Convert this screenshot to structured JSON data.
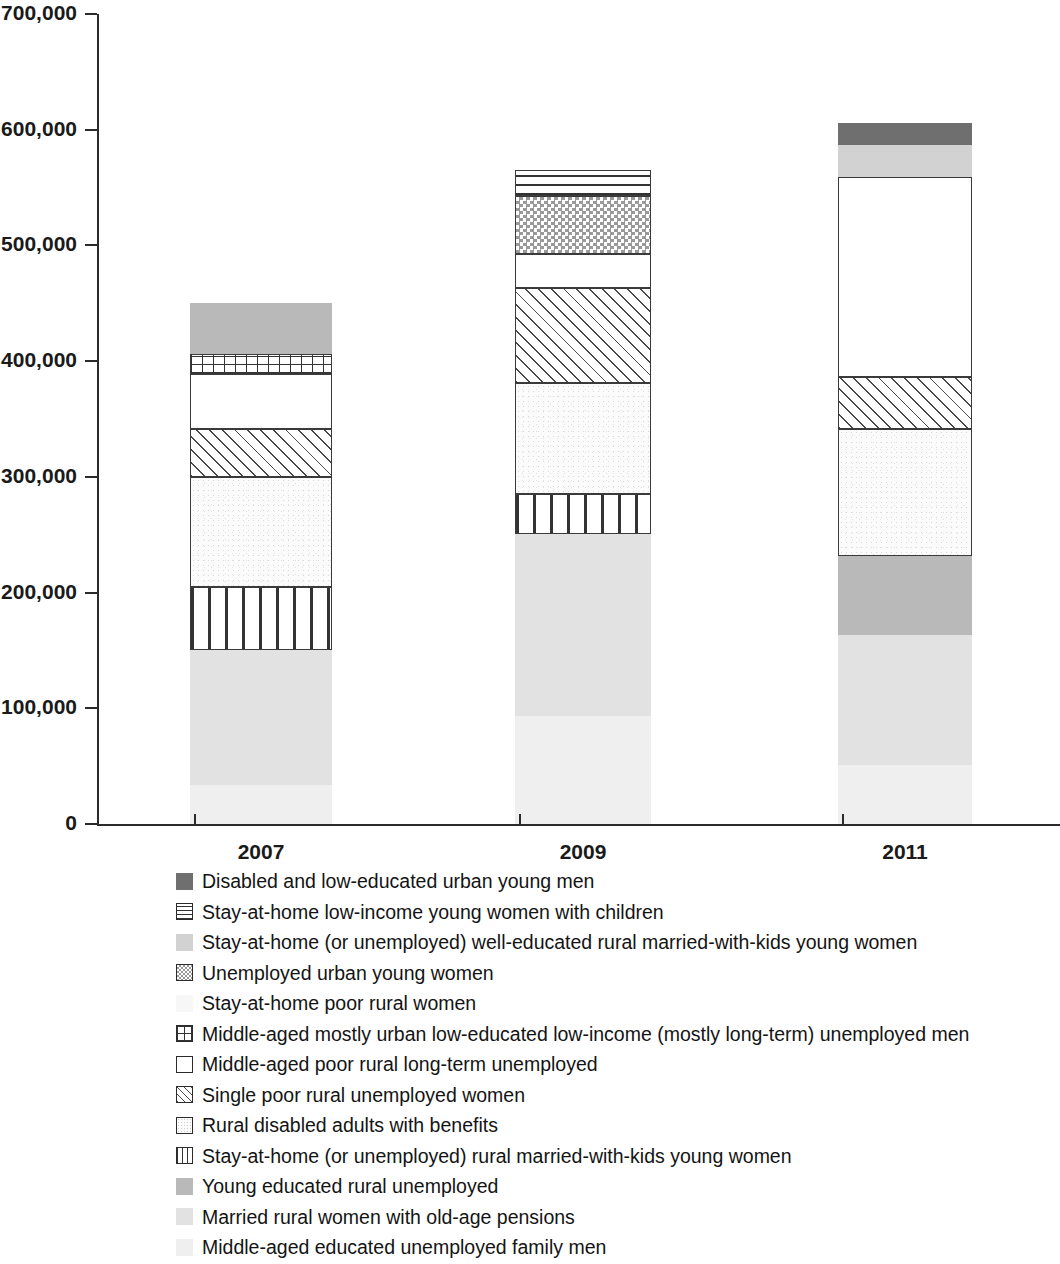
{
  "chart_data": {
    "type": "bar",
    "subtype": "stacked-bar",
    "title": "",
    "xlabel": "",
    "ylabel": "",
    "categories": [
      "2007",
      "2009",
      "2011"
    ],
    "ylim": [
      0,
      700000
    ],
    "ytick_labels": [
      "0",
      "100,000",
      "200,000",
      "300,000",
      "400,000",
      "500,000",
      "600,000",
      "700,000"
    ],
    "ytick_values": [
      0,
      100000,
      200000,
      300000,
      400000,
      500000,
      600000,
      700000
    ],
    "grid": false,
    "legend_position": "below",
    "totals": [
      456000,
      565000,
      604000
    ],
    "series": [
      {
        "name": "Disabled and low-educated urban young men",
        "pattern": "solid-dark-gray",
        "color": "#6f6f6f",
        "values": [
          0,
          0,
          19000
        ]
      },
      {
        "name": "Stay-at-home low-income young women with children",
        "pattern": "horizontal-lines",
        "color": "#ffffff",
        "values": [
          0,
          22000,
          0
        ]
      },
      {
        "name": "Stay-at-home (or unemployed) well-educated rural married-with-kids young women",
        "pattern": "solid-light-gray",
        "color": "#d2d2d2",
        "values": [
          0,
          0,
          28000
        ]
      },
      {
        "name": "Unemployed urban young women",
        "pattern": "checkerboard",
        "color": "#9a9a9a",
        "values": [
          0,
          50000,
          0
        ]
      },
      {
        "name": "Stay-at-home poor rural women",
        "pattern": "very-faint-speckle",
        "color": "#f7f7f7",
        "values": [
          44000,
          0,
          0
        ]
      },
      {
        "name": "Middle-aged mostly urban low-educated low-income (mostly long-term) unemployed men",
        "pattern": "grid",
        "color": "#ffffff",
        "values": [
          17000,
          0,
          0
        ]
      },
      {
        "name": "Middle-aged poor rural long-term unemployed",
        "pattern": "white-outline",
        "color": "#ffffff",
        "values": [
          48000,
          30000,
          173000
        ]
      },
      {
        "name": "Single poor rural unemployed women",
        "pattern": "diagonal-hatch",
        "color": "#ffffff",
        "values": [
          41000,
          82000,
          45000
        ]
      },
      {
        "name": "Rural disabled adults with benefits",
        "pattern": "fine-speckle-outline",
        "color": "#fbfbfb",
        "values": [
          95000,
          96000,
          109000
        ]
      },
      {
        "name": "Stay-at-home (or unemployed) rural married-with-kids young women",
        "pattern": "vertical-bars",
        "color": "#ffffff",
        "values": [
          55000,
          34000,
          0
        ]
      },
      {
        "name": "Young educated rural unemployed",
        "pattern": "solid-gray",
        "color": "#b9b9b9",
        "values": [
          0,
          0,
          69000
        ]
      },
      {
        "name": "Married rural women with old-age pensions",
        "pattern": "solid-pale-gray",
        "color": "#dcdcdc",
        "values": [
          116000,
          158000,
          112000
        ]
      },
      {
        "name": "Middle-aged educated unemployed family men",
        "pattern": "solid-palest",
        "color": "#f0f0f0",
        "values": [
          34000,
          93000,
          51000
        ]
      }
    ],
    "bars": [
      {
        "category": "2007",
        "total": 456000,
        "segments_bottom_to_top": [
          {
            "label": "Middle-aged educated unemployed family men",
            "value": 34000,
            "pattern": "solid-palest"
          },
          {
            "label": "Married rural women with old-age pensions",
            "value": 116000,
            "pattern": "solid-pale-gray"
          },
          {
            "label": "Stay-at-home (or unemployed) rural married-with-kids young women",
            "value": 55000,
            "pattern": "vertical-bars"
          },
          {
            "label": "Rural disabled adults with benefits",
            "value": 95000,
            "pattern": "fine-speckle-outline"
          },
          {
            "label": "Single poor rural unemployed women",
            "value": 41000,
            "pattern": "diagonal-hatch"
          },
          {
            "label": "Middle-aged poor rural long-term unemployed",
            "value": 48000,
            "pattern": "white-outline"
          },
          {
            "label": "Middle-aged mostly urban low-educated low-income (mostly long-term) unemployed men",
            "value": 17000,
            "pattern": "grid"
          },
          {
            "label": "Stay-at-home poor rural women",
            "value": 44000,
            "pattern": "solid-gray"
          }
        ]
      },
      {
        "category": "2009",
        "total": 565000,
        "segments_bottom_to_top": [
          {
            "label": "Middle-aged educated unemployed family men",
            "value": 93000,
            "pattern": "solid-palest"
          },
          {
            "label": "Married rural women with old-age pensions",
            "value": 158000,
            "pattern": "solid-pale-gray"
          },
          {
            "label": "Stay-at-home (or unemployed) rural married-with-kids young women",
            "value": 34000,
            "pattern": "vertical-bars"
          },
          {
            "label": "Rural disabled adults with benefits",
            "value": 96000,
            "pattern": "fine-speckle-outline"
          },
          {
            "label": "Single poor rural unemployed women",
            "value": 82000,
            "pattern": "diagonal-hatch"
          },
          {
            "label": "Middle-aged poor rural long-term unemployed",
            "value": 30000,
            "pattern": "white-outline"
          },
          {
            "label": "Unemployed urban young women",
            "value": 50000,
            "pattern": "checkerboard"
          },
          {
            "label": "Stay-at-home low-income young women with children",
            "value": 22000,
            "pattern": "horizontal-lines"
          }
        ]
      },
      {
        "category": "2011",
        "total": 604000,
        "segments_bottom_to_top": [
          {
            "label": "Middle-aged educated unemployed family men",
            "value": 51000,
            "pattern": "solid-palest"
          },
          {
            "label": "Married rural women with old-age pensions",
            "value": 112000,
            "pattern": "solid-pale-gray"
          },
          {
            "label": "Young educated rural unemployed",
            "value": 69000,
            "pattern": "solid-gray"
          },
          {
            "label": "Rural disabled adults with benefits",
            "value": 109000,
            "pattern": "fine-speckle-outline"
          },
          {
            "label": "Single poor rural unemployed women",
            "value": 45000,
            "pattern": "diagonal-hatch"
          },
          {
            "label": "Middle-aged poor rural long-term unemployed",
            "value": 173000,
            "pattern": "white-outline"
          },
          {
            "label": "Stay-at-home (or unemployed) well-educated rural married-with-kids young women",
            "value": 28000,
            "pattern": "solid-light-gray"
          },
          {
            "label": "Disabled and low-educated urban young men",
            "value": 19000,
            "pattern": "solid-dark-gray"
          }
        ]
      }
    ]
  },
  "legend": {
    "items": [
      {
        "pattern": "p-darkgray",
        "label": "Disabled and low-educated urban young men"
      },
      {
        "pattern": "p-hlines",
        "label": "Stay-at-home low-income young women with children"
      },
      {
        "pattern": "p-lightgray",
        "label": "Stay-at-home (or unemployed) well-educated rural married-with-kids young women"
      },
      {
        "pattern": "p-checker",
        "label": "Unemployed urban young women"
      },
      {
        "pattern": "p-faint",
        "label": "Stay-at-home poor rural women"
      },
      {
        "pattern": "p-grid",
        "label": "Middle-aged mostly urban low-educated low-income (mostly long-term) unemployed men"
      },
      {
        "pattern": "p-white",
        "label": "Middle-aged poor rural long-term unemployed"
      },
      {
        "pattern": "p-hatch",
        "label": "Single poor rural unemployed women"
      },
      {
        "pattern": "p-speckle",
        "label": "Rural disabled adults with benefits"
      },
      {
        "pattern": "p-vbars",
        "label": "Stay-at-home (or unemployed) rural married-with-kids young women"
      },
      {
        "pattern": "p-gray",
        "label": "Young educated rural unemployed"
      },
      {
        "pattern": "p-lighter",
        "label": "Married rural women with old-age pensions"
      },
      {
        "pattern": "p-palest",
        "label": "Middle-aged educated unemployed family men"
      }
    ]
  }
}
